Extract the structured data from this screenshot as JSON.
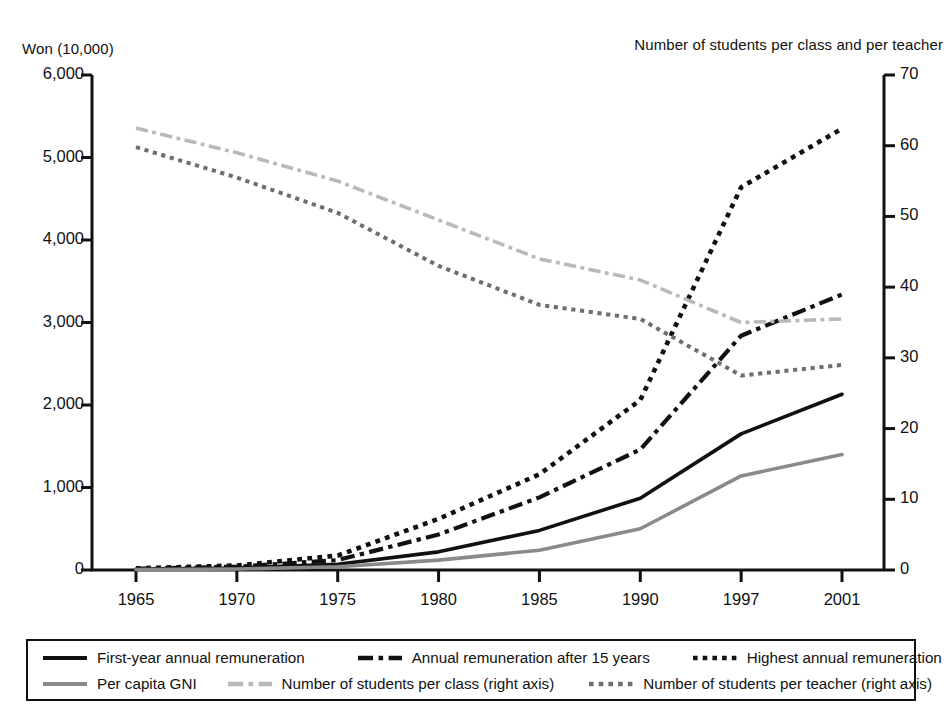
{
  "axis_titles": {
    "left": "Won (10,000)",
    "right": "Number of students per class and per teacher"
  },
  "colors": {
    "series_black": "#111111",
    "series_gray": "#8a8a8a",
    "series_light_gray": "#b9b9b9",
    "series_mid_gray": "#6f6f6f",
    "axis": "#111111",
    "background": "#ffffff"
  },
  "legend": {
    "items": [
      {
        "label": "First-year annual remuneration",
        "style": "solid",
        "color": "#111111"
      },
      {
        "label": "Annual remuneration after 15 years",
        "style": "dash-dot",
        "color": "#111111"
      },
      {
        "label": "Highest annual  remuneration",
        "style": "dotted",
        "color": "#111111"
      },
      {
        "label": "Per capita GNI",
        "style": "solid",
        "color": "#8a8a8a"
      },
      {
        "label": "Number of students per class (right axis)",
        "style": "dash-dot",
        "color": "#b9b9b9"
      },
      {
        "label": "Number of students per teacher (right axis)",
        "style": "dotted",
        "color": "#6f6f6f"
      }
    ]
  },
  "chart_data": {
    "type": "line",
    "title": "",
    "xlabel": "",
    "ylabel": "Won (10,000)",
    "y2label": "Number of students per class and per teacher",
    "grid": false,
    "legend_position": "bottom",
    "categories": [
      "1965",
      "1970",
      "1975",
      "1980",
      "1985",
      "1990",
      "1997",
      "2001"
    ],
    "x": [
      1965,
      1970,
      1975,
      1980,
      1985,
      1990,
      1997,
      2001
    ],
    "ylim": [
      0,
      6000
    ],
    "yticks": [
      "0",
      "1,000",
      "2,000",
      "3,000",
      "4,000",
      "5,000",
      "6,000"
    ],
    "ytick_values": [
      0,
      1000,
      2000,
      3000,
      4000,
      5000,
      6000
    ],
    "y2lim": [
      0,
      70
    ],
    "y2ticks": [
      "0",
      "10",
      "20",
      "30",
      "40",
      "50",
      "60",
      "70"
    ],
    "y2tick_values": [
      0,
      10,
      20,
      30,
      40,
      50,
      60,
      70
    ],
    "series": [
      {
        "name": "First-year annual remuneration",
        "axis": "left",
        "style": "solid",
        "color": "#111111",
        "width": 3.6,
        "values": [
          10,
          25,
          70,
          220,
          480,
          870,
          1650,
          2130
        ]
      },
      {
        "name": "Annual remuneration after 15 years",
        "axis": "left",
        "style": "dash-dot",
        "color": "#111111",
        "width": 4.2,
        "values": [
          15,
          40,
          120,
          430,
          880,
          1460,
          2840,
          3340
        ]
      },
      {
        "name": "Highest annual  remuneration",
        "axis": "left",
        "style": "dotted",
        "color": "#111111",
        "width": 4.6,
        "values": [
          20,
          55,
          175,
          620,
          1160,
          2060,
          4640,
          5350
        ]
      },
      {
        "name": "Per capita GNI",
        "axis": "left",
        "style": "solid",
        "color": "#8a8a8a",
        "width": 3.6,
        "values": [
          5,
          12,
          40,
          120,
          240,
          500,
          1140,
          1400
        ]
      },
      {
        "name": "Number of students per class (right axis)",
        "axis": "right",
        "style": "dash-dot",
        "color": "#b9b9b9",
        "width": 3.6,
        "values": [
          62.5,
          59.0,
          55.0,
          49.5,
          44.0,
          41.0,
          35.0,
          35.5
        ]
      },
      {
        "name": "Number of students per teacher (right axis)",
        "axis": "right",
        "style": "dotted",
        "color": "#6f6f6f",
        "width": 4.0,
        "values": [
          59.8,
          55.5,
          50.5,
          43.0,
          37.5,
          35.5,
          27.5,
          29.0
        ]
      }
    ]
  }
}
